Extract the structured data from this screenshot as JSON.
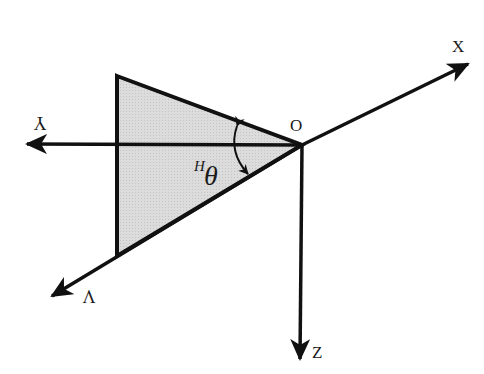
{
  "diagram": {
    "type": "coordinate-frame",
    "colors": {
      "background": "#ffffff",
      "stroke": "#111111",
      "fill_region": "#d9d9d9"
    },
    "origin": {
      "label": "O",
      "x": 302,
      "y": 145
    },
    "axes": [
      {
        "name": "X",
        "label": "X",
        "from": [
          302,
          145
        ],
        "to": [
          468,
          64
        ],
        "label_pos": [
          458,
          48
        ],
        "rotated": false
      },
      {
        "name": "Y",
        "label": "Y",
        "from": [
          302,
          145
        ],
        "to": [
          27,
          144
        ],
        "label_pos": [
          40,
          120
        ],
        "rotated": true
      },
      {
        "name": "Z",
        "label": "Z",
        "from": [
          302,
          145
        ],
        "to": [
          300,
          359
        ],
        "label_pos": [
          318,
          357
        ],
        "rotated": false
      },
      {
        "name": "V",
        "label": "V",
        "from": [
          302,
          145
        ],
        "to": [
          52,
          296
        ],
        "label_pos": [
          88,
          297
        ],
        "rotated": true
      }
    ],
    "region": {
      "vertices": [
        [
          117,
          76
        ],
        [
          302,
          145
        ],
        [
          117,
          256
        ]
      ]
    },
    "angle": {
      "symbol": "θ",
      "superscript": "H",
      "label": "Hθ"
    }
  }
}
